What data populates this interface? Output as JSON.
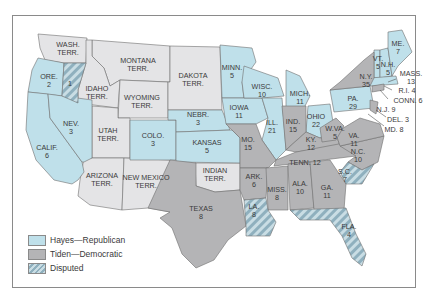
{
  "colors": {
    "republican": "#bfe0ea",
    "democratic": "#b4b4b6",
    "disputed_base": "#c9dde4",
    "disputed_stripe": "#8fb0be",
    "territory": "#e4e4e6",
    "border": "#6e6e6e"
  },
  "legend": [
    {
      "key": "republican",
      "label": "Hayes—Republican"
    },
    {
      "key": "democratic",
      "label": "Tiden—Democratic"
    },
    {
      "key": "disputed",
      "label": "Disputed"
    }
  ],
  "regions": [
    {
      "id": "wash",
      "name": "WASH.",
      "line2": "TERR.",
      "type": "territory"
    },
    {
      "id": "ore",
      "name": "ORE.",
      "line2": "2",
      "type": "republican"
    },
    {
      "id": "ore-disputed",
      "name": "1",
      "line2": "",
      "type": "disputed"
    },
    {
      "id": "idaho",
      "name": "IDAHO",
      "line2": "TERR.",
      "type": "territory"
    },
    {
      "id": "montana",
      "name": "MONTANA",
      "line2": "TERR.",
      "type": "territory"
    },
    {
      "id": "wyoming",
      "name": "WYOMING",
      "line2": "TERR.",
      "type": "territory"
    },
    {
      "id": "dakota",
      "name": "DAKOTA",
      "line2": "TERR.",
      "type": "territory"
    },
    {
      "id": "calif",
      "name": "CALIF.",
      "line2": "6",
      "type": "republican"
    },
    {
      "id": "nev",
      "name": "NEV.",
      "line2": "3",
      "type": "republican"
    },
    {
      "id": "utah",
      "name": "UTAH",
      "line2": "TERR.",
      "type": "territory"
    },
    {
      "id": "colo",
      "name": "COLO.",
      "line2": "3",
      "type": "republican"
    },
    {
      "id": "nebr",
      "name": "NEBR.",
      "line2": "3",
      "type": "republican"
    },
    {
      "id": "kansas",
      "name": "KANSAS",
      "line2": "5",
      "type": "republican"
    },
    {
      "id": "arizona",
      "name": "ARIZONA",
      "line2": "TERR.",
      "type": "territory"
    },
    {
      "id": "newmexico",
      "name": "NEW MEXICO",
      "line2": "TERR.",
      "type": "territory"
    },
    {
      "id": "indian",
      "name": "INDIAN",
      "line2": "TERR.",
      "type": "territory"
    },
    {
      "id": "texas",
      "name": "TEXAS",
      "line2": "8",
      "type": "democratic"
    },
    {
      "id": "minn",
      "name": "MINN.",
      "line2": "5",
      "type": "republican"
    },
    {
      "id": "iowa",
      "name": "IOWA",
      "line2": "11",
      "type": "republican"
    },
    {
      "id": "mo",
      "name": "MO.",
      "line2": "15",
      "type": "democratic"
    },
    {
      "id": "ark",
      "name": "ARK.",
      "line2": "6",
      "type": "democratic"
    },
    {
      "id": "la",
      "name": "LA.",
      "line2": "8",
      "type": "disputed"
    },
    {
      "id": "wisc",
      "name": "WISC.",
      "line2": "10",
      "type": "republican"
    },
    {
      "id": "ill",
      "name": "ILL.",
      "line2": "21",
      "type": "republican"
    },
    {
      "id": "mich",
      "name": "MICH.",
      "line2": "11",
      "type": "republican"
    },
    {
      "id": "ind",
      "name": "IND.",
      "line2": "15",
      "type": "democratic"
    },
    {
      "id": "ohio",
      "name": "OHIO",
      "line2": "22",
      "type": "republican"
    },
    {
      "id": "ky",
      "name": "KY.",
      "line2": "12",
      "type": "democratic"
    },
    {
      "id": "tenn",
      "name": "TENN. 12",
      "line2": "",
      "type": "democratic"
    },
    {
      "id": "miss",
      "name": "MISS.",
      "line2": "8",
      "type": "democratic"
    },
    {
      "id": "ala",
      "name": "ALA.",
      "line2": "10",
      "type": "democratic"
    },
    {
      "id": "ga",
      "name": "GA.",
      "line2": "11",
      "type": "democratic"
    },
    {
      "id": "fla",
      "name": "FLA.",
      "line2": "4",
      "type": "disputed"
    },
    {
      "id": "sc",
      "name": "S.C.",
      "line2": "7",
      "type": "disputed"
    },
    {
      "id": "nc",
      "name": "N.C.",
      "line2": "10",
      "type": "democratic"
    },
    {
      "id": "va",
      "name": "VA.",
      "line2": "11",
      "type": "democratic"
    },
    {
      "id": "wva",
      "name": "W.VA.",
      "line2": "5",
      "type": "democratic"
    },
    {
      "id": "pa",
      "name": "PA.",
      "line2": "29",
      "type": "republican"
    },
    {
      "id": "ny",
      "name": "N.Y.",
      "line2": "35",
      "type": "democratic"
    },
    {
      "id": "vt",
      "name": "VT.",
      "line2": "5",
      "type": "republican"
    },
    {
      "id": "nh",
      "name": "N.H.",
      "line2": "5",
      "type": "republican"
    },
    {
      "id": "me",
      "name": "ME.",
      "line2": "7",
      "type": "republican"
    },
    {
      "id": "mass",
      "name": "MASS.",
      "line2": "13",
      "type": "republican"
    },
    {
      "id": "ri",
      "name": "R.I. 4",
      "line2": "",
      "type": "republican"
    },
    {
      "id": "conn",
      "name": "CONN. 6",
      "line2": "",
      "type": "democratic"
    },
    {
      "id": "nj",
      "name": "N.J. 9",
      "line2": "",
      "type": "democratic"
    },
    {
      "id": "del",
      "name": "DEL. 3",
      "line2": "",
      "type": "democratic"
    },
    {
      "id": "md",
      "name": "MD. 8",
      "line2": "",
      "type": "democratic"
    }
  ]
}
